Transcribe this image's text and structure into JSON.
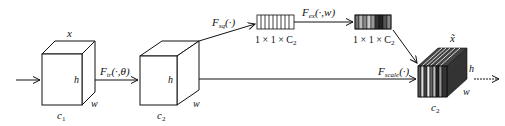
{
  "diagram": {
    "type": "squeeze-and-excitation block",
    "input_tensor": {
      "top_label": "x",
      "height_label": "h",
      "width_label": "w",
      "channel_label": "c",
      "channel_sub": "1"
    },
    "transform": {
      "label": "F",
      "sub": "tr",
      "args": "(·,θ)"
    },
    "feature_tensor": {
      "height_label": "h",
      "width_label": "w",
      "channel_label": "c",
      "channel_sub": "2"
    },
    "squeeze": {
      "label": "F",
      "sub": "sq",
      "args": "(·)",
      "shape_label": "1 × 1 × C",
      "shape_sub": "2"
    },
    "excitation": {
      "label": "F",
      "sub": "ex",
      "args": "(·,w)",
      "shape_label": "1 × 1 × C",
      "shape_sub": "2"
    },
    "scale": {
      "label": "F",
      "sub": "scale",
      "args": "(·)"
    },
    "output_tensor": {
      "top_label": "x̃",
      "height_label": "h",
      "width_label": "w",
      "channel_label": "c",
      "channel_sub": "2"
    }
  },
  "colors": {
    "line": "#111111",
    "background": "#ffffff"
  }
}
